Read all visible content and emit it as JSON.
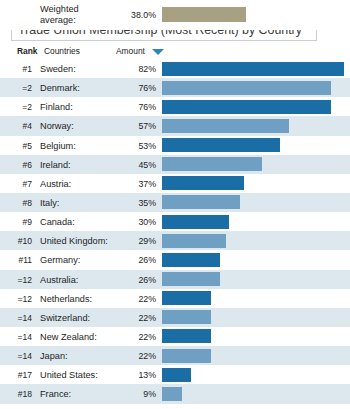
{
  "figure": {
    "marker_icon": "triangle-down-icon",
    "label": "FIGURE 9.11",
    "subtitle": "Trade Union Membership (Most Recent) by Country"
  },
  "table": {
    "headers": {
      "rank": "Rank",
      "countries": "Countries",
      "amount": "Amount",
      "sort_icon": "caret-down-icon"
    }
  },
  "colors": {
    "bar_dark": "#1a6ea5",
    "bar_light": "#6f9fc2",
    "bar_average": "#a8a083",
    "row_stripe": "#dce7ee",
    "accent": "#3aa9cf"
  },
  "chart_data": {
    "type": "bar",
    "title": "FIGURE 9.11",
    "subtitle": "Trade Union Membership (Most Recent) by Country",
    "xlabel": "",
    "ylabel": "Countries",
    "xlim": [
      0,
      82
    ],
    "grid": false,
    "legend": null,
    "orientation": "horizontal",
    "value_suffix": "%",
    "categories": [
      "Sweden",
      "Denmark",
      "Finland",
      "Norway",
      "Belgium",
      "Ireland",
      "Austria",
      "Italy",
      "Canada",
      "United Kingdom",
      "Germany",
      "Australia",
      "Netherlands",
      "Switzerland",
      "New Zealand",
      "Japan",
      "United States",
      "France"
    ],
    "values": [
      82,
      76,
      76,
      57,
      53,
      45,
      37,
      35,
      30,
      29,
      26,
      26,
      22,
      22,
      22,
      22,
      13,
      9
    ],
    "ranks": [
      "#1",
      "=2",
      "=2",
      "#4",
      "#5",
      "#6",
      "#7",
      "#8",
      "#9",
      "#10",
      "#11",
      "=12",
      "=12",
      "=14",
      "=14",
      "=14",
      "#17",
      "#18"
    ],
    "rows": [
      {
        "rank": "#1",
        "country": "Sweden:",
        "amount": "82%",
        "value": 82
      },
      {
        "rank": "=2",
        "country": "Denmark:",
        "amount": "76%",
        "value": 76
      },
      {
        "rank": "=2",
        "country": "Finland:",
        "amount": "76%",
        "value": 76
      },
      {
        "rank": "#4",
        "country": "Norway:",
        "amount": "57%",
        "value": 57
      },
      {
        "rank": "#5",
        "country": "Belgium:",
        "amount": "53%",
        "value": 53
      },
      {
        "rank": "#6",
        "country": "Ireland:",
        "amount": "45%",
        "value": 45
      },
      {
        "rank": "#7",
        "country": "Austria:",
        "amount": "37%",
        "value": 37
      },
      {
        "rank": "#8",
        "country": "Italy:",
        "amount": "35%",
        "value": 35
      },
      {
        "rank": "#9",
        "country": "Canada:",
        "amount": "30%",
        "value": 30
      },
      {
        "rank": "#10",
        "country": "United Kingdom:",
        "amount": "29%",
        "value": 29
      },
      {
        "rank": "#11",
        "country": "Germany:",
        "amount": "26%",
        "value": 26
      },
      {
        "rank": "=12",
        "country": "Australia:",
        "amount": "26%",
        "value": 26
      },
      {
        "rank": "=12",
        "country": "Netherlands:",
        "amount": "22%",
        "value": 22
      },
      {
        "rank": "=14",
        "country": "Switzerland:",
        "amount": "22%",
        "value": 22
      },
      {
        "rank": "=14",
        "country": "New Zealand:",
        "amount": "22%",
        "value": 22
      },
      {
        "rank": "=14",
        "country": "Japan:",
        "amount": "22%",
        "value": 22
      },
      {
        "rank": "#17",
        "country": "United States:",
        "amount": "13%",
        "value": 13
      },
      {
        "rank": "#18",
        "country": "France:",
        "amount": "9%",
        "value": 9
      }
    ],
    "summary": {
      "label_line1": "Weighted",
      "label_line2": "average:",
      "amount": "38.0%",
      "value": 38.0
    }
  }
}
